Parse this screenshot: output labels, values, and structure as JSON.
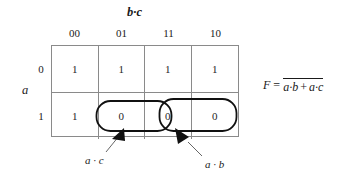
{
  "figure": {
    "name": "karnaugh-map-3-variable",
    "column_group_label": "b·c",
    "row_group_label": "a",
    "column_headers": [
      "00",
      "01",
      "11",
      "10"
    ],
    "row_headers": [
      "0",
      "1"
    ],
    "rows": [
      {
        "header": "0",
        "cells": [
          "1",
          "1",
          "1",
          "1"
        ]
      },
      {
        "header": "1",
        "cells": [
          "1",
          "0",
          "0",
          "0"
        ]
      }
    ],
    "groupings": [
      {
        "label": "a · c",
        "name": "group-ac",
        "cells": "row 1, columns 01 and 11"
      },
      {
        "label": "a · b",
        "name": "group-ab",
        "cells": "row 1, columns 11 and 10"
      }
    ],
    "equation": {
      "lhs": "F",
      "equals": "=",
      "negated_expression": "a·b + a·c",
      "term1": "a·b",
      "operator": "+",
      "term2": "a·c"
    },
    "colors": {
      "grid_line": "#8a8a8a",
      "group_outline": "#111111",
      "text": "#1a1a1a",
      "background": "#ffffff"
    }
  }
}
